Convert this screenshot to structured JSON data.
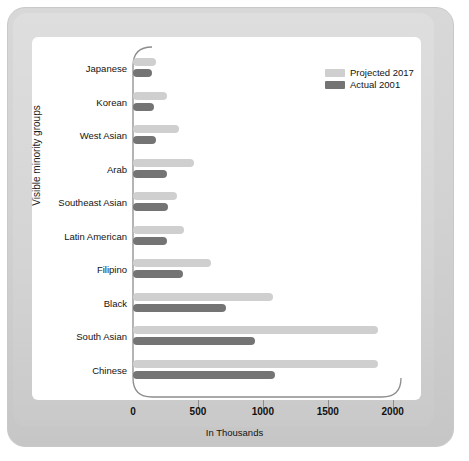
{
  "chart_data": {
    "type": "bar",
    "orientation": "horizontal",
    "title": "",
    "xlabel": "In Thousands",
    "ylabel": "Visible minority groups",
    "xlim": [
      0,
      2200
    ],
    "xticks": [
      0,
      500,
      1000,
      1500,
      2000
    ],
    "xtick_labels": [
      "0",
      "500",
      "1000",
      "1500",
      "2000"
    ],
    "grid": false,
    "legend_position": "top-right",
    "categories": [
      "Japanese",
      "Korean",
      "West Asian",
      "Arab",
      "Southeast Asian",
      "Latin American",
      "Filipino",
      "Black",
      "South Asian",
      "Chinese"
    ],
    "series": [
      {
        "name": "Projected 2017",
        "color": "#cfcfcf",
        "values": [
          175,
          260,
          355,
          470,
          340,
          395,
          600,
          1080,
          1890,
          1885
        ]
      },
      {
        "name": "Actual 2001",
        "color": "#747474",
        "values": [
          145,
          160,
          175,
          265,
          270,
          265,
          385,
          715,
          940,
          1095
        ]
      }
    ]
  },
  "colors": {
    "projected": "#cfcfcf",
    "actual": "#747474",
    "axis": "#8d8d8d",
    "panel": "#ffffff",
    "frame": "#d2d2d2"
  }
}
